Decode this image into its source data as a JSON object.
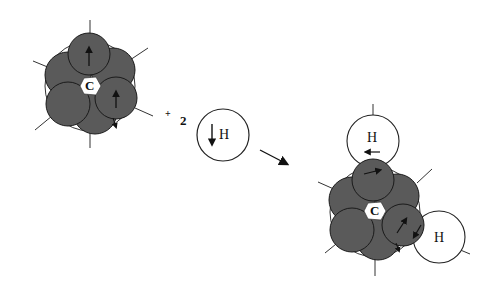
{
  "diagram": {
    "colors": {
      "lobe_fill": "#5a5a5a",
      "lobe_stroke": "#1a1a1a",
      "outline": "#222222",
      "background": "#ffffff"
    },
    "reactant_carbon": {
      "label": "C"
    },
    "operator": {
      "plus": "+",
      "coefficient": "2"
    },
    "reactant_hydrogen": {
      "label": "H",
      "spin": "down"
    },
    "reaction_arrow": {
      "direction": "right-down"
    },
    "product": {
      "carbon_label": "C",
      "hydrogen_top": {
        "label": "H",
        "spin": "left"
      },
      "hydrogen_right": {
        "label": "H",
        "spin": "down-left"
      }
    }
  }
}
